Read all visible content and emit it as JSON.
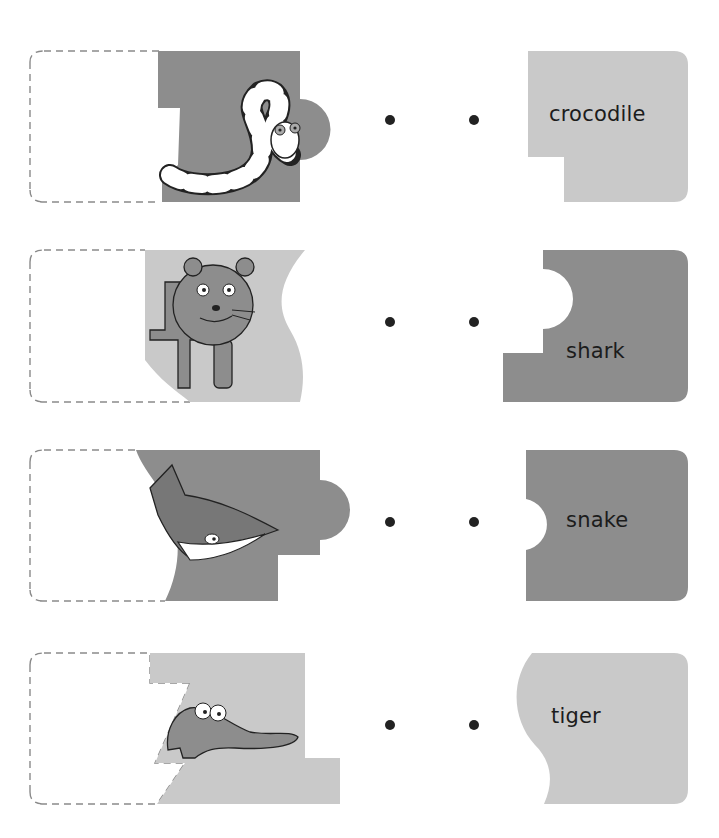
{
  "colors": {
    "dark_piece": "#8d8d8d",
    "light_piece": "#c9c9c9",
    "dashed_outline": "#8a8a8a",
    "dot": "#222222",
    "text": "#1c1c1c"
  },
  "rows": [
    {
      "animal_picture": "snake-picture",
      "picture_piece_shade": "dark",
      "word_piece_shade": "light",
      "word": "crocodile"
    },
    {
      "animal_picture": "tiger-picture",
      "picture_piece_shade": "light",
      "word_piece_shade": "dark",
      "word": "shark"
    },
    {
      "animal_picture": "shark-picture",
      "picture_piece_shade": "dark",
      "word_piece_shade": "dark",
      "word": "snake"
    },
    {
      "animal_picture": "crocodile-picture",
      "picture_piece_shade": "light",
      "word_piece_shade": "light",
      "word": "tiger"
    }
  ],
  "dots_per_row": 2
}
